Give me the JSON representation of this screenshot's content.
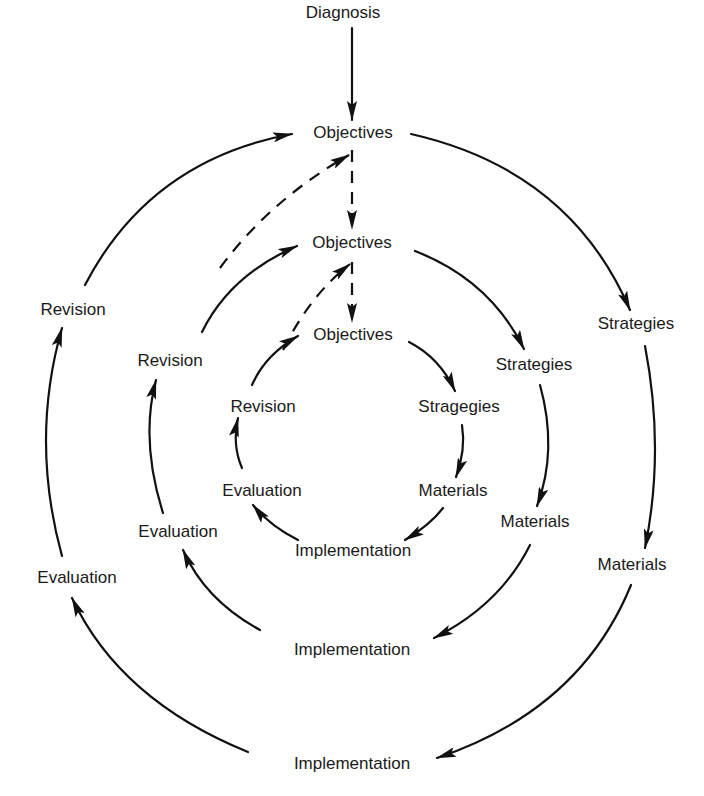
{
  "diagram": {
    "type": "concentric-cycle",
    "entry": "Diagnosis",
    "cycles": {
      "outer": {
        "objectives": "Objectives",
        "strategies": "Strategies",
        "materials": "Materials",
        "implementation": "Implementation",
        "evaluation": "Evaluation",
        "revision": "Revision"
      },
      "middle": {
        "objectives": "Objectives",
        "strategies": "Strategies",
        "materials": "Materials",
        "implementation": "Implementation",
        "evaluation": "Evaluation",
        "revision": "Revision"
      },
      "inner": {
        "objectives": "Objectives",
        "strategies": "Stragegies",
        "materials": "Materials",
        "implementation": "Implementation",
        "evaluation": "Evaluation",
        "revision": "Revision"
      }
    },
    "edges": [
      {
        "from": "Diagnosis",
        "to": "Objectives (outer)",
        "style": "solid"
      },
      {
        "from": "Objectives (outer)",
        "to": "Strategies (outer)",
        "style": "solid"
      },
      {
        "from": "Strategies (outer)",
        "to": "Materials (outer)",
        "style": "solid"
      },
      {
        "from": "Materials (outer)",
        "to": "Implementation (outer)",
        "style": "solid"
      },
      {
        "from": "Implementation (outer)",
        "to": "Evaluation (outer)",
        "style": "solid"
      },
      {
        "from": "Evaluation (outer)",
        "to": "Revision (outer)",
        "style": "solid"
      },
      {
        "from": "Revision (outer)",
        "to": "Objectives (outer)",
        "style": "solid"
      },
      {
        "from": "Objectives (outer)",
        "to": "Objectives (middle)",
        "style": "dashed"
      },
      {
        "from": "Revision (middle)",
        "to": "Objectives (outer)",
        "style": "dashed"
      },
      {
        "from": "Objectives (middle)",
        "to": "Strategies (middle)",
        "style": "solid"
      },
      {
        "from": "Strategies (middle)",
        "to": "Materials (middle)",
        "style": "solid"
      },
      {
        "from": "Materials (middle)",
        "to": "Implementation (middle)",
        "style": "solid"
      },
      {
        "from": "Implementation (middle)",
        "to": "Evaluation (middle)",
        "style": "solid"
      },
      {
        "from": "Evaluation (middle)",
        "to": "Revision (middle)",
        "style": "solid"
      },
      {
        "from": "Revision (middle)",
        "to": "Objectives (middle)",
        "style": "solid"
      },
      {
        "from": "Objectives (middle)",
        "to": "Objectives (inner)",
        "style": "dashed"
      },
      {
        "from": "Revision (inner)",
        "to": "Objectives (middle)",
        "style": "dashed"
      },
      {
        "from": "Objectives (inner)",
        "to": "Stragegies (inner)",
        "style": "solid"
      },
      {
        "from": "Stragegies (inner)",
        "to": "Materials (inner)",
        "style": "solid"
      },
      {
        "from": "Materials (inner)",
        "to": "Implementation (inner)",
        "style": "solid"
      },
      {
        "from": "Implementation (inner)",
        "to": "Evaluation (inner)",
        "style": "solid"
      },
      {
        "from": "Evaluation (inner)",
        "to": "Revision (inner)",
        "style": "solid"
      },
      {
        "from": "Revision (inner)",
        "to": "Objectives (inner)",
        "style": "solid"
      }
    ]
  }
}
